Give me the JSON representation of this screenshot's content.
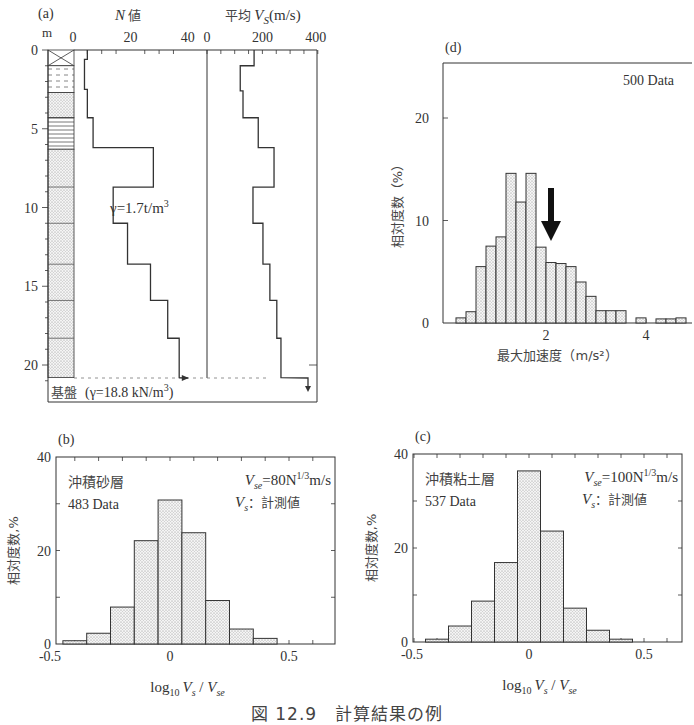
{
  "caption": "図 12.9　計算結果の例",
  "chart_data": [
    {
      "panel": "(a)",
      "type": "line",
      "title": "",
      "ylabel": "m",
      "depth_ticks": [
        "0",
        "5",
        "10",
        "15",
        "20"
      ],
      "n_axis": {
        "label_var": "N",
        "label_suffix": "値",
        "ticks": [
          "0",
          "20",
          "40"
        ]
      },
      "vs_axis": {
        "label_prefix": "平均",
        "label_var": "V",
        "label_sub": "S",
        "label_unit": "(m/s)",
        "ticks": [
          "0",
          "200",
          "400"
        ]
      },
      "series": [
        {
          "name": "N値",
          "steps": [
            {
              "from": 0,
              "to": 0.6,
              "value": 5
            },
            {
              "from": 0.6,
              "to": 2.5,
              "value": 4
            },
            {
              "from": 2.5,
              "to": 4.3,
              "value": 5
            },
            {
              "from": 4.3,
              "to": 6.2,
              "value": 7
            },
            {
              "from": 6.2,
              "to": 8.7,
              "value": 28
            },
            {
              "from": 8.7,
              "to": 11.0,
              "value": 14
            },
            {
              "from": 11.0,
              "to": 13.6,
              "value": 19
            },
            {
              "from": 13.6,
              "to": 15.9,
              "value": 27
            },
            {
              "from": 15.9,
              "to": 18.3,
              "value": 33
            },
            {
              "from": 18.3,
              "to": 20.8,
              "value": 37
            }
          ]
        },
        {
          "name": "平均Vs",
          "steps": [
            {
              "from": 0,
              "to": 1.0,
              "value": 170
            },
            {
              "from": 1.0,
              "to": 2.6,
              "value": 120
            },
            {
              "from": 2.6,
              "to": 4.3,
              "value": 130
            },
            {
              "from": 4.3,
              "to": 6.2,
              "value": 185
            },
            {
              "from": 6.2,
              "to": 8.7,
              "value": 242
            },
            {
              "from": 8.7,
              "to": 11.0,
              "value": 166
            },
            {
              "from": 11.0,
              "to": 13.6,
              "value": 202
            },
            {
              "from": 13.6,
              "to": 15.9,
              "value": 227
            },
            {
              "from": 15.9,
              "to": 18.3,
              "value": 252
            },
            {
              "from": 18.3,
              "to": 20.8,
              "value": 267
            }
          ]
        }
      ],
      "annotations": {
        "layer_density": "γ=1.7t/m",
        "layer_density_sup": "3",
        "bedrock": "基盤",
        "bedrock_density": "(γ=18.8 kN/m",
        "bedrock_density_sup": "3",
        "bedrock_close": ")"
      },
      "ylim": [
        0,
        21
      ]
    },
    {
      "panel": "(b)",
      "type": "bar",
      "title": "沖積砂層",
      "count_label": "483 Data",
      "formula": {
        "lhs": "V",
        "lhs_sub": "se",
        "rhs": "=80N",
        "rhs_sup": "1/3",
        "unit": "m/s"
      },
      "formula2": {
        "var": "V",
        "sub": "s",
        "text": "：計測値"
      },
      "xlabel": "log10 Vs / Vse",
      "ylabel": "相対度数,%",
      "x_ticks": [
        "-0.5",
        "0",
        "0.5"
      ],
      "y_ticks": [
        "0",
        "20",
        "40"
      ],
      "categories": [
        -0.4,
        -0.3,
        -0.2,
        -0.1,
        0.0,
        0.1,
        0.2,
        0.3,
        0.4
      ],
      "values": [
        0.7,
        2.3,
        7.9,
        22.1,
        30.8,
        23.8,
        9.3,
        3.2,
        1.2
      ],
      "ylim": [
        0,
        40
      ]
    },
    {
      "panel": "(c)",
      "type": "bar",
      "title": "沖積粘土層",
      "count_label": "537 Data",
      "formula": {
        "lhs": "V",
        "lhs_sub": "se",
        "rhs": "=100N",
        "rhs_sup": "1/3",
        "unit": "m/s"
      },
      "formula2": {
        "var": "V",
        "sub": "s",
        "text": "：計測値"
      },
      "xlabel": "log10 Vs / Vse",
      "ylabel": "相対度数,%",
      "x_ticks": [
        "-0.5",
        "0",
        "0.5"
      ],
      "y_ticks": [
        "0",
        "20",
        "40"
      ],
      "categories": [
        -0.4,
        -0.3,
        -0.2,
        -0.1,
        0.0,
        0.1,
        0.2,
        0.3,
        0.4
      ],
      "values": [
        0.6,
        3.4,
        8.7,
        16.9,
        36.4,
        23.6,
        7.2,
        2.5,
        0.6
      ],
      "ylim": [
        0,
        40
      ]
    },
    {
      "panel": "(d)",
      "type": "bar",
      "title": "",
      "count_label": "500 Data",
      "xlabel": "最大加速度（m/s²）",
      "ylabel": "相対度数（%）",
      "x_ticks": [
        "2",
        "4"
      ],
      "y_ticks": [
        "0",
        "10",
        "20"
      ],
      "bin_width": 0.2,
      "categories": [
        0.3,
        0.5,
        0.7,
        0.9,
        1.1,
        1.3,
        1.5,
        1.7,
        1.9,
        2.1,
        2.3,
        2.5,
        2.7,
        2.9,
        3.1,
        3.3,
        3.5,
        3.7,
        3.9,
        4.1,
        4.3,
        4.5,
        4.7
      ],
      "values": [
        0.5,
        1.1,
        5.5,
        7.5,
        8.4,
        14.6,
        11.8,
        14.6,
        7.4,
        5.9,
        5.8,
        5.5,
        4.0,
        2.6,
        1.2,
        1.2,
        1.2,
        0,
        0.5,
        0,
        0.4,
        0.4,
        0.5
      ],
      "arrow_at": 2.1,
      "ylim": [
        0,
        25
      ],
      "xlim": [
        0,
        4.9
      ]
    }
  ]
}
